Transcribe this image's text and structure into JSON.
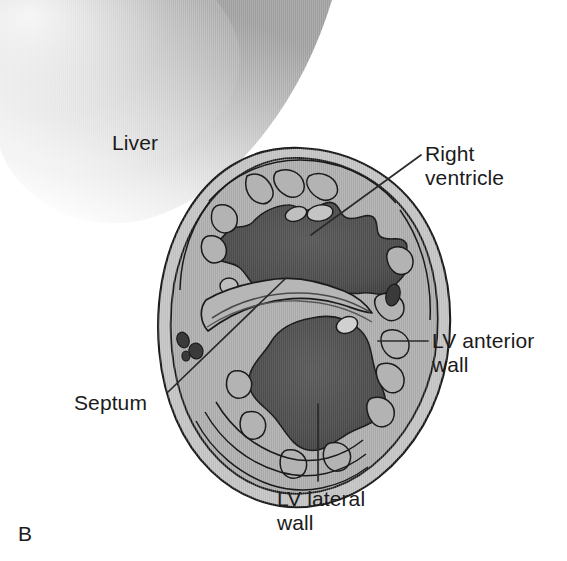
{
  "figure": {
    "panel_letter": "B",
    "kind": "anatomical-cross-section",
    "background_color": "#ffffff"
  },
  "labels": {
    "liver": "Liver",
    "right_ventricle": "Right\nventricle",
    "lv_anterior_wall": "LV anterior\nwall",
    "lv_lateral_wall": "LV lateral\nwall",
    "septum": "Septum"
  },
  "colors": {
    "outline": "#1b1b1b",
    "leader_line": "#2a2a2a",
    "myocardium": "#a9a9a9",
    "myocardium_light": "#c3c3c3",
    "epicardial_rim": "#bdbdbd",
    "cavity_dark": "#4b4b4b",
    "cavity_dark_edge": "#3a3a3a",
    "vessel_dark": "#3c3c3c",
    "liver_gradient_start": "#b8b8b8",
    "liver_gradient_end": "#ffffff",
    "text": "#1b1b1b"
  },
  "structures": [
    {
      "name": "liver",
      "label_key": "liver",
      "shading": "soft-gradient",
      "outline": false
    },
    {
      "name": "right-ventricle-cavity",
      "label_key": "right_ventricle",
      "fill": "cavity_dark"
    },
    {
      "name": "left-ventricle-cavity",
      "label_key": "lv_lateral_wall",
      "fill": "cavity_dark"
    },
    {
      "name": "interventricular-septum",
      "label_key": "septum",
      "fill": "myocardium"
    },
    {
      "name": "lv-anterior-wall",
      "label_key": "lv_anterior_wall",
      "fill": "myocardium"
    },
    {
      "name": "epicardium",
      "fill": "epicardial_rim"
    },
    {
      "name": "coronary-vessels",
      "fill": "vessel_dark",
      "count": 5
    }
  ],
  "leader_lines": [
    {
      "name": "right-ventricle-leader",
      "from": [
        421,
        155
      ],
      "to": [
        311,
        235
      ],
      "style": "diagonal"
    },
    {
      "name": "lv-anterior-wall-leader",
      "from": [
        428,
        341
      ],
      "to": [
        378,
        341
      ],
      "style": "horizontal"
    },
    {
      "name": "lv-lateral-wall-leader",
      "from": [
        318,
        481
      ],
      "to": [
        318,
        404
      ],
      "style": "vertical"
    },
    {
      "name": "septum-leader",
      "from": [
        168,
        392
      ],
      "to": [
        286,
        278
      ],
      "style": "diagonal"
    }
  ]
}
